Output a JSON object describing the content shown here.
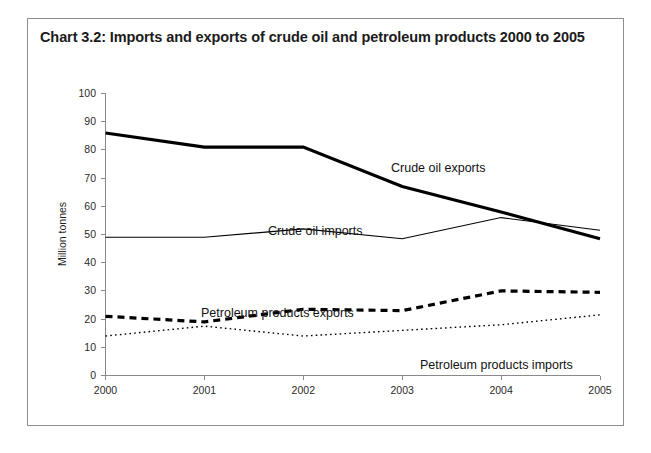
{
  "figure": {
    "title": "Chart 3.2:  Imports and exports of crude oil and petroleum products 2000 to 2005"
  },
  "chart_data": {
    "type": "line",
    "title": "Chart 3.2:  Imports and exports of crude oil and petroleum products 2000 to 2005",
    "xlabel": "",
    "ylabel": "Million tonnes",
    "x": [
      "2000",
      "2001",
      "2002",
      "2003",
      "2004",
      "2005"
    ],
    "categories": [
      "2000",
      "2001",
      "2002",
      "2003",
      "2004",
      "2005"
    ],
    "xticklabels": [
      "2000",
      "2001",
      "2002",
      "2003",
      "2004",
      "2005"
    ],
    "yticklabels": [
      "0",
      "10",
      "20",
      "30",
      "40",
      "50",
      "60",
      "70",
      "80",
      "90",
      "100"
    ],
    "yticks": [
      0,
      10,
      20,
      30,
      40,
      50,
      60,
      70,
      80,
      90,
      100
    ],
    "ylim": [
      0,
      100
    ],
    "grid": false,
    "legend_position": "inline-annotations",
    "series": [
      {
        "name": "Crude oil exports",
        "style": "solid-thick",
        "values": [
          86,
          81,
          81,
          67,
          58,
          48.5
        ]
      },
      {
        "name": "Crude oil imports",
        "style": "solid-thin",
        "values": [
          49,
          49,
          52,
          48.5,
          56,
          51.5
        ]
      },
      {
        "name": "Petroleum products exports",
        "style": "dashed-thick",
        "values": [
          21,
          19,
          23.5,
          23,
          30,
          29.5
        ]
      },
      {
        "name": "Petroleum products imports",
        "style": "dotted-thin",
        "values": [
          14,
          17.5,
          14,
          16,
          18,
          21.5
        ]
      }
    ],
    "annotations": [
      {
        "text": "Crude oil exports",
        "x_px": 363,
        "y_px": 153
      },
      {
        "text": "Crude oil imports",
        "x_px": 240,
        "y_px": 216
      },
      {
        "text": "Petroleum products exports",
        "x_px": 173,
        "y_px": 298
      },
      {
        "text": "Petroleum products imports",
        "x_px": 392,
        "y_px": 350
      }
    ]
  },
  "axis": {
    "y_title": "Million tonnes",
    "y_ticks": [
      "100",
      "90",
      "80",
      "70",
      "60",
      "50",
      "40",
      "30",
      "20",
      "10",
      "0"
    ],
    "x_ticks": [
      "2000",
      "2001",
      "2002",
      "2003",
      "2004",
      "2005"
    ]
  }
}
